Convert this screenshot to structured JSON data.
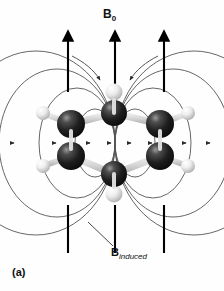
{
  "figure": {
    "panel_label": "(a)",
    "background_color": "#fefefe",
    "width": 224,
    "height": 291,
    "caption_alt": "Benzene ring in an applied magnetic field B0 showing the induced ring-current magnetic field Binduced"
  },
  "labels": {
    "applied_field": {
      "symbol": "B",
      "subscript": "0",
      "full": "B0",
      "x": 103,
      "y": 8
    },
    "induced_field": {
      "symbol": "B",
      "subscript": "induced",
      "full": "Binduced",
      "x": 111,
      "y": 247
    }
  },
  "colors": {
    "carbon": "#1c1c1c",
    "carbon_highlight": "#8a8a8a",
    "hydrogen": "#e8e8e8",
    "hydrogen_shade": "#b4b4b4",
    "bond": "#d8d8d8",
    "field_line": "#555555",
    "applied_arrow": "#000000",
    "text": "#111111",
    "background": "#fefefe"
  },
  "applied_field_arrows": [
    {
      "name": "left-field-arrow",
      "x": 68,
      "top_y": 31,
      "bottom_y": 253
    },
    {
      "name": "center-field-arrow",
      "x": 115,
      "top_y": 31,
      "bottom_y": 253
    },
    {
      "name": "right-field-arrow",
      "x": 164,
      "top_y": 31,
      "bottom_y": 253
    }
  ],
  "induced_field_loops": {
    "count_per_side": 4,
    "center_x": 115,
    "center_y": 143,
    "description": "nested concentric ellipses representing the induced ring-current field",
    "left_rx": [
      20,
      38,
      58,
      80
    ],
    "right_rx": [
      20,
      38,
      58,
      80
    ],
    "ry": [
      34,
      55,
      74,
      92
    ],
    "arrow_direction": "clockwise-from-viewer"
  },
  "molecule": {
    "name": "benzene",
    "formula": "C6H6",
    "carbon_atoms": [
      {
        "name": "carbon-top",
        "cx": 114,
        "cy": 113,
        "r": 13
      },
      {
        "name": "carbon-upper-left",
        "cx": 71,
        "cy": 124,
        "r": 14
      },
      {
        "name": "carbon-lower-left",
        "cx": 71,
        "cy": 156,
        "r": 14
      },
      {
        "name": "carbon-bottom",
        "cx": 114,
        "cy": 174,
        "r": 13
      },
      {
        "name": "carbon-upper-right",
        "cx": 160,
        "cy": 124,
        "r": 14
      },
      {
        "name": "carbon-lower-right",
        "cx": 160,
        "cy": 156,
        "r": 14
      }
    ],
    "hydrogen_atoms": [
      {
        "name": "hydrogen-top",
        "cx": 114,
        "cy": 92,
        "r": 8
      },
      {
        "name": "hydrogen-upper-left",
        "cx": 43,
        "cy": 113,
        "r": 7
      },
      {
        "name": "hydrogen-lower-left",
        "cx": 43,
        "cy": 166,
        "r": 7
      },
      {
        "name": "hydrogen-bottom",
        "cx": 114,
        "cy": 194,
        "r": 8
      },
      {
        "name": "hydrogen-upper-right",
        "cx": 188,
        "cy": 113,
        "r": 7
      },
      {
        "name": "hydrogen-lower-right",
        "cx": 188,
        "cy": 166,
        "r": 7
      }
    ],
    "ring_bonds": [
      {
        "from": "carbon-top",
        "to": "carbon-upper-left"
      },
      {
        "from": "carbon-upper-left",
        "to": "carbon-lower-left"
      },
      {
        "from": "carbon-lower-left",
        "to": "carbon-bottom"
      },
      {
        "from": "carbon-bottom",
        "to": "carbon-lower-right"
      },
      {
        "from": "carbon-lower-right",
        "to": "carbon-upper-right"
      },
      {
        "from": "carbon-upper-right",
        "to": "carbon-top"
      }
    ],
    "ch_bonds": [
      {
        "from": "carbon-top",
        "to": "hydrogen-top"
      },
      {
        "from": "carbon-upper-left",
        "to": "hydrogen-upper-left"
      },
      {
        "from": "carbon-lower-left",
        "to": "hydrogen-lower-left"
      },
      {
        "from": "carbon-bottom",
        "to": "hydrogen-bottom"
      },
      {
        "from": "carbon-upper-right",
        "to": "hydrogen-upper-right"
      },
      {
        "from": "carbon-lower-right",
        "to": "hydrogen-lower-right"
      }
    ]
  },
  "leader_line": {
    "name": "binduced-leader",
    "from_x": 88,
    "from_y": 222,
    "to_x": 113,
    "to_y": 246
  }
}
